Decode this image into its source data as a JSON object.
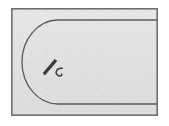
{
  "document": {
    "kind": "scanned-line-drawing",
    "title": "Rounded-end plate outline with handwritten annotation",
    "width_px": 169,
    "height_px": 126
  },
  "colors": {
    "page_background": "#ffffff",
    "plate_fill": "#e2e2e2",
    "frame_stroke": "#6f6f6f",
    "outline_stroke": "#595959",
    "annotation_ink": "#3a3a3a"
  },
  "frame": {
    "name": "outer rectangular border",
    "x": 11,
    "y": 8,
    "width": 147,
    "height": 108,
    "stroke_width": 1.6,
    "fill": "#e2e2e2"
  },
  "shapes": [
    {
      "id": "u-outline",
      "name": "stadium outline open to the right",
      "description": "Two horizontal parallel lines joined at the left by a semicircular arc; the right side is open and runs to the frame edge.",
      "top_line": {
        "x1": 58,
        "y1": 20,
        "x2": 157,
        "y2": 20
      },
      "bottom_line": {
        "x1": 58,
        "y1": 104,
        "x2": 157,
        "y2": 104
      },
      "arc": {
        "center_x": 58,
        "center_y": 62,
        "radius_x": 36,
        "radius_y": 42,
        "sweep": "left semicircle from top line to bottom line"
      },
      "stroke_width": 1.3
    }
  ],
  "annotation": {
    "id": "pen-mark",
    "name": "handwritten pen stroke with small c-shaped mark",
    "description": "A short thick diagonal stroke resembling a pen or pencil nib, drawn lower-left to upper-right, with a small hooked c-like mark at its lower right.",
    "stroke": {
      "x1": 44,
      "y1": 74,
      "x2": 56,
      "y2": 60,
      "thickness": 3.4
    },
    "hook": {
      "cx": 60,
      "cy": 71,
      "radius": 3.0
    },
    "ink_color": "#3a3a3a"
  },
  "labels": {
    "figure_alt": "Scanned technical drawing of a rectangular plate containing a rounded-end slot outline, annotated by hand."
  }
}
